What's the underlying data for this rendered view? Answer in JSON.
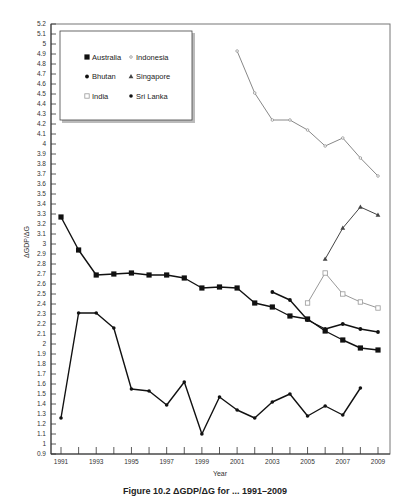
{
  "chart_data": {
    "type": "line",
    "title": "",
    "xlabel": "Year",
    "ylabel": "ΔGDP/ΔG",
    "ylim": [
      0.9,
      5.2
    ],
    "xlim": [
      1991,
      2009
    ],
    "grid": false,
    "legend_position": "upper-left inset box",
    "y_ticks": [
      "0.9",
      "1",
      "1.1",
      "1.2",
      "1.3",
      "1.4",
      "1.5",
      "1.6",
      "1.7",
      "1.8",
      "1.9",
      "2",
      "2.1",
      "2.2",
      "2.3",
      "2.4",
      "2.5",
      "2.6",
      "2.7",
      "2.8",
      "2.9",
      "3",
      "3.1",
      "3.2",
      "3.3",
      "3.4",
      "3.5",
      "3.6",
      "3.7",
      "3.8",
      "3.9",
      "4",
      "4.1",
      "4.2",
      "4.3",
      "4.4",
      "4.5",
      "4.6",
      "4.7",
      "4.8",
      "4.9",
      "5",
      "5.1",
      "5.2"
    ],
    "x_tick_labels": [
      "1991",
      "1993",
      "1995",
      "1997",
      "1999",
      "2001",
      "2003",
      "2005",
      "2007",
      "2009"
    ],
    "series": [
      {
        "name": "Australia",
        "marker": "square",
        "color": "#111111",
        "x": [
          1991,
          1992,
          1993,
          1994,
          1995,
          1996,
          1997,
          1998,
          1999,
          2000,
          2001,
          2002,
          2003,
          2004,
          2005,
          2006,
          2007,
          2008,
          2009
        ],
        "values": [
          3.27,
          2.94,
          2.69,
          2.7,
          2.71,
          2.69,
          2.69,
          2.66,
          2.56,
          2.57,
          2.56,
          2.41,
          2.37,
          2.28,
          2.25,
          2.13,
          2.04,
          1.96,
          1.94
        ]
      },
      {
        "name": "Indonesia",
        "marker": "small-open-circle",
        "color": "#888888",
        "x": [
          2001,
          2002,
          2003,
          2004,
          2005,
          2006,
          2007,
          2008,
          2009
        ],
        "values": [
          4.93,
          4.51,
          4.24,
          4.24,
          4.14,
          3.98,
          4.06,
          3.86,
          3.68
        ]
      },
      {
        "name": "Bhutan",
        "marker": "diamond",
        "color": "#111111",
        "x": [
          2003,
          2004,
          2005,
          2006,
          2007,
          2008,
          2009
        ],
        "values": [
          2.52,
          2.44,
          2.24,
          2.15,
          2.2,
          2.15,
          2.12
        ]
      },
      {
        "name": "Singapore",
        "marker": "triangle",
        "color": "#444444",
        "x": [
          2006,
          2007,
          2008,
          2009
        ],
        "values": [
          2.85,
          3.16,
          3.37,
          3.29
        ]
      },
      {
        "name": "India",
        "marker": "open-square",
        "color": "#999999",
        "x": [
          2005,
          2006,
          2007,
          2008,
          2009
        ],
        "values": [
          2.41,
          2.71,
          2.5,
          2.42,
          2.36
        ]
      },
      {
        "name": "Sri Lanka",
        "marker": "circle",
        "color": "#111111",
        "x": [
          1991,
          1992,
          1993,
          1994,
          1995,
          1996,
          1997,
          1998,
          1999,
          2000,
          2001,
          2002,
          2003,
          2004,
          2005,
          2006,
          2007,
          2008
        ],
        "values": [
          1.26,
          2.31,
          2.31,
          2.16,
          1.55,
          1.53,
          1.39,
          1.62,
          1.1,
          1.47,
          1.34,
          1.26,
          1.42,
          1.5,
          1.28,
          1.38,
          1.29,
          1.56
        ]
      }
    ]
  },
  "caption": "Figure 10.2   ΔGDP/ΔG for ...  1991–2009"
}
